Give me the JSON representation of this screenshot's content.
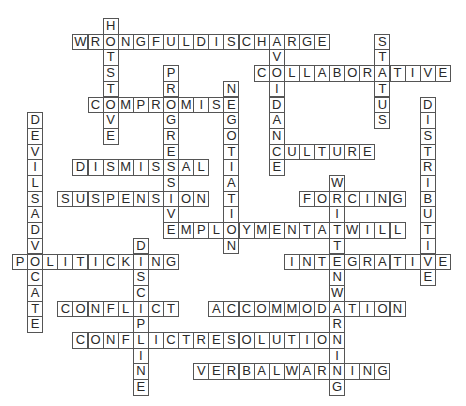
{
  "puzzle": {
    "type": "crossword-solution",
    "words": {
      "hot_stove": "HOTSTOVE",
      "wrongful_discharge": "WRONGFULDISCHARGE",
      "avoidance": "AVOIDANCE",
      "status": "STATUS",
      "collaborative": "COLLABORATIVE",
      "progressive": "PROGRESSIVE",
      "negotiation": "NEGOTIATION",
      "compromise": "COMPROMISE",
      "distributive": "DISTRIBUTIVE",
      "devils_advocate": "DEVILSADVOCATE",
      "culture": "CULTURE",
      "dismissal": "DISMISSAL",
      "suspension": "SUSPENSION",
      "written_warning": "WRITTENWARNING",
      "forcing": "FORCING",
      "employment_at_will": "EMPLOYMENTATWILL",
      "discipline": "DISCIPLINE",
      "politicking": "POLITICKING",
      "integrative": "INTEGRATIVE",
      "conflict": "CONFLICT",
      "accommodation": "ACCOMMODATION",
      "conflict_resolution": "CONFLICTRESOLUTION",
      "verbal_warning": "VERBALWARNING"
    }
  }
}
